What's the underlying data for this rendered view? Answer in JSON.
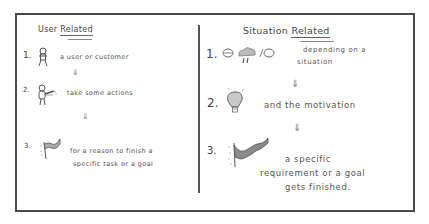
{
  "left_panel": {
    "title_plain": "User",
    "title_underlined": "Related",
    "steps": [
      {
        "number": "1.",
        "icon": "person-icon",
        "text": "a user or customer"
      },
      {
        "number": "2.",
        "icon": "person-acting-icon",
        "text": "take some actions"
      },
      {
        "number": "3.",
        "icon": "flag-icon",
        "text_line1": "for a reason to finish a",
        "text_line2": "specific task or a goal"
      }
    ],
    "arrow": "⇓"
  },
  "right_panel": {
    "title_plain": "Situation",
    "title_underlined": "Related",
    "steps": [
      {
        "number": "1.",
        "icon": "weather-situation-icon",
        "text_line1": "depending on a",
        "text_line2": "situation"
      },
      {
        "number": "2.",
        "icon": "lightbulb-icon",
        "text": "and the motivation"
      },
      {
        "number": "3.",
        "icon": "flag-icon",
        "text_line1": "a specific",
        "text_line2": "requirement or a goal",
        "text_line3": "gets finished."
      }
    ],
    "arrow": "⇓"
  },
  "colors": {
    "frame": "#4a4a4a",
    "ink": "#444444",
    "fill_gray": "#8a8a8a"
  }
}
